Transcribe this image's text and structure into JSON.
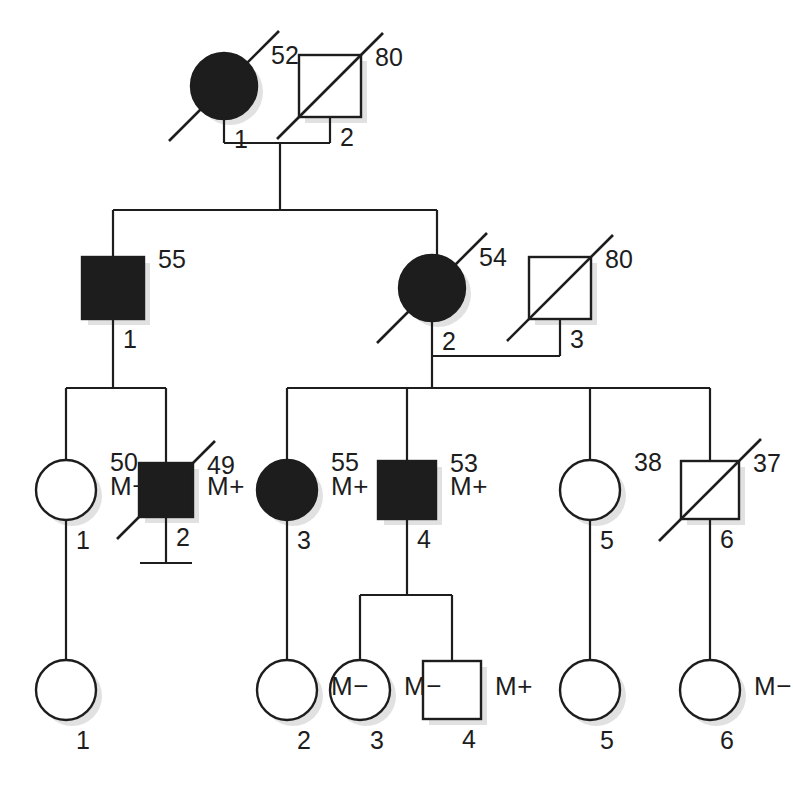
{
  "chart_data": {
    "type": "diagram",
    "diagram_kind": "pedigree",
    "title": "",
    "generations": 4,
    "legend_symbols": {
      "circle": "female",
      "square": "male",
      "filled": "affected",
      "open": "unaffected",
      "diagonal_slash": "deceased",
      "vertical_bar_stub": "no offspring",
      "M+": "mutation carrier positive",
      "M-": "mutation carrier negative"
    },
    "individuals": [
      {
        "id": "I-1",
        "gen": 1,
        "num": "1",
        "sex": "female",
        "shape": "circle",
        "affected": true,
        "deceased": true,
        "age": "52",
        "marker": "",
        "cx": 224,
        "cy": 86,
        "r": 33
      },
      {
        "id": "I-2",
        "gen": 1,
        "num": "2",
        "sex": "male",
        "shape": "square",
        "affected": false,
        "deceased": true,
        "age": "80",
        "marker": "",
        "cx": 330,
        "cy": 86,
        "r": 31
      },
      {
        "id": "II-1",
        "gen": 2,
        "num": "1",
        "sex": "male",
        "shape": "square",
        "affected": true,
        "deceased": false,
        "age": "55",
        "marker": "",
        "cx": 113,
        "cy": 288,
        "r": 31
      },
      {
        "id": "II-2",
        "gen": 2,
        "num": "2",
        "sex": "female",
        "shape": "circle",
        "affected": true,
        "deceased": true,
        "age": "54",
        "marker": "",
        "cx": 432,
        "cy": 288,
        "r": 33
      },
      {
        "id": "II-3",
        "gen": 2,
        "num": "3",
        "sex": "male",
        "shape": "square",
        "affected": false,
        "deceased": true,
        "age": "80",
        "marker": "",
        "cx": 560,
        "cy": 288,
        "r": 31
      },
      {
        "id": "III-1",
        "gen": 3,
        "num": "1",
        "sex": "female",
        "shape": "circle",
        "affected": false,
        "deceased": false,
        "age": "50",
        "marker": "M−",
        "cx": 66,
        "cy": 490,
        "r": 30
      },
      {
        "id": "III-2",
        "gen": 3,
        "num": "2",
        "sex": "male",
        "shape": "square",
        "affected": true,
        "deceased": true,
        "age": "49",
        "marker": "M+",
        "cx": 166,
        "cy": 490,
        "r": 27,
        "no_offspring": true
      },
      {
        "id": "III-3",
        "gen": 3,
        "num": "3",
        "sex": "female",
        "shape": "circle",
        "affected": true,
        "deceased": false,
        "age": "55",
        "marker": "M+",
        "cx": 287,
        "cy": 490,
        "r": 30
      },
      {
        "id": "III-4",
        "gen": 3,
        "num": "4",
        "sex": "male",
        "shape": "square",
        "affected": true,
        "deceased": false,
        "age": "53",
        "marker": "M+",
        "cx": 407,
        "cy": 490,
        "r": 29
      },
      {
        "id": "III-5",
        "gen": 3,
        "num": "5",
        "sex": "female",
        "shape": "circle",
        "affected": false,
        "deceased": false,
        "age": "38",
        "marker": "",
        "cx": 590,
        "cy": 490,
        "r": 30
      },
      {
        "id": "III-6",
        "gen": 3,
        "num": "6",
        "sex": "male",
        "shape": "square",
        "affected": false,
        "deceased": true,
        "age": "37",
        "marker": "",
        "cx": 710,
        "cy": 490,
        "r": 29
      },
      {
        "id": "IV-1",
        "gen": 4,
        "num": "1",
        "sex": "female",
        "shape": "circle",
        "affected": false,
        "deceased": false,
        "age": "",
        "marker": "",
        "cx": 66,
        "cy": 690,
        "r": 30
      },
      {
        "id": "IV-2",
        "gen": 4,
        "num": "2",
        "sex": "female",
        "shape": "circle",
        "affected": false,
        "deceased": false,
        "age": "",
        "marker": "M−",
        "cx": 287,
        "cy": 690,
        "r": 30
      },
      {
        "id": "IV-3",
        "gen": 4,
        "num": "3",
        "sex": "female",
        "shape": "circle",
        "affected": false,
        "deceased": false,
        "age": "",
        "marker": "M−",
        "cx": 360,
        "cy": 690,
        "r": 30
      },
      {
        "id": "IV-4",
        "gen": 4,
        "num": "4",
        "sex": "male",
        "shape": "square",
        "affected": false,
        "deceased": false,
        "age": "",
        "marker": "M+",
        "cx": 452,
        "cy": 690,
        "r": 29
      },
      {
        "id": "IV-5",
        "gen": 4,
        "num": "5",
        "sex": "female",
        "shape": "circle",
        "affected": false,
        "deceased": false,
        "age": "",
        "marker": "",
        "cx": 590,
        "cy": 690,
        "r": 30
      },
      {
        "id": "IV-6",
        "gen": 4,
        "num": "6",
        "sex": "female",
        "shape": "circle",
        "affected": false,
        "deceased": false,
        "age": "",
        "marker": "M−",
        "cx": 710,
        "cy": 690,
        "r": 30
      }
    ],
    "matings": [
      {
        "id": "mate-I",
        "left": "I-1",
        "right": "I-2",
        "y": 143,
        "x1": 224,
        "x2": 330,
        "drop_x": 280
      },
      {
        "id": "mate-II",
        "left": "II-2",
        "right": "II-3",
        "y": 356,
        "x1": 432,
        "x2": 560,
        "drop_x": 432
      }
    ],
    "sibships": [
      {
        "id": "sibship-II",
        "bar_y": 210,
        "x1": 113,
        "x2": 437,
        "from_x": 280,
        "from_y": 143,
        "children_x": [
          113,
          437
        ]
      },
      {
        "id": "sibship-III-left",
        "bar_y": 388,
        "x1": 66,
        "x2": 166,
        "from_x": 113,
        "from_y": 319,
        "children_x": [
          66,
          166
        ]
      },
      {
        "id": "sibship-III-right",
        "bar_y": 388,
        "x1": 287,
        "x2": 710,
        "from_x": 432,
        "from_y": 356,
        "children_x": [
          287,
          407,
          590,
          710
        ]
      },
      {
        "id": "sibship-IV-mid",
        "bar_y": 595,
        "x1": 360,
        "x2": 452,
        "from_x": 407,
        "from_y": 519,
        "children_x": [
          360,
          452
        ]
      }
    ],
    "single_descents": [
      {
        "id": "descent-III1-IV1",
        "x": 66,
        "y1": 520,
        "y2": 660
      },
      {
        "id": "descent-III3-IV2",
        "x": 287,
        "y1": 520,
        "y2": 660
      },
      {
        "id": "descent-III5-IV5",
        "x": 590,
        "y1": 520,
        "y2": 660
      },
      {
        "id": "descent-III6-IV6",
        "x": 710,
        "y1": 519,
        "y2": 660
      }
    ],
    "no_offspring_stub": {
      "x": 166,
      "y1": 517,
      "y2": 563,
      "bar_half_width": 26
    },
    "ages": [
      "52",
      "80",
      "55",
      "54",
      "80",
      "50",
      "49",
      "55",
      "53",
      "38",
      "37"
    ],
    "markers": [
      "M−",
      "M+",
      "M+",
      "M+",
      "M−",
      "M−",
      "M+",
      "M−"
    ],
    "colors": {
      "line": "#1d1d1d",
      "affected_fill": "#1d1d1d",
      "unaffected_fill": "#ffffff",
      "background": "#ffffff",
      "text": "#1d1d1d"
    }
  }
}
